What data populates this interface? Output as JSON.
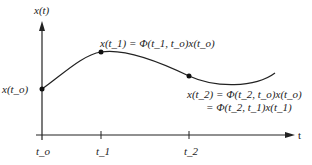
{
  "diagram": {
    "y_axis_label": "x(t)",
    "x_axis_label": "t",
    "ticks": [
      {
        "label": "t_o",
        "x": 42
      },
      {
        "label": "t_1",
        "x": 101
      },
      {
        "label": "t_2",
        "x": 189
      }
    ],
    "points": [
      {
        "name": "x(t_o)",
        "x": 42,
        "y": 89,
        "label": "x(t_o)"
      },
      {
        "name": "x(t_1)",
        "x": 101,
        "y": 52,
        "label": "x(t_1) = Φ(t_1, t_o)x(t_o)"
      },
      {
        "name": "x(t_2)",
        "x": 189,
        "y": 76,
        "label_line1": "x(t_2) = Φ(t_2, t_o)x(t_o)",
        "label_line2": "= Φ(t_2, t_1)x(t_1)"
      }
    ],
    "colors": {
      "line": "#222222",
      "background": "#ffffff"
    }
  }
}
